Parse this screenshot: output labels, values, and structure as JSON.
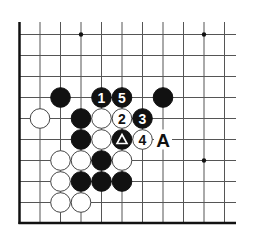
{
  "diagram": {
    "type": "go-board-fragment",
    "grid": {
      "columns": 11,
      "rows": 9,
      "origin_x": 19.5,
      "origin_y": 34.5,
      "col_spacing": 20.5,
      "row_spacing": 21,
      "top_y": 22,
      "bottom_edge_y": 223,
      "right_x": 236,
      "left_edge": true,
      "bottom_edge": true
    },
    "colors": {
      "line": "#555555",
      "edge": "#111111",
      "black_stone": "#111111",
      "white_stone": "#ffffff",
      "stone_outline": "#444444"
    },
    "star_points": [
      {
        "col": 3,
        "row": 0
      },
      {
        "col": 9,
        "row": 0
      },
      {
        "col": 9,
        "row": 6
      }
    ],
    "stones": [
      {
        "color": "black",
        "col": 2,
        "row": 3,
        "label": ""
      },
      {
        "color": "black",
        "col": 4,
        "row": 3,
        "label": "1"
      },
      {
        "color": "black",
        "col": 5,
        "row": 3,
        "label": "5"
      },
      {
        "color": "black",
        "col": 7,
        "row": 3,
        "label": ""
      },
      {
        "color": "white",
        "col": 1,
        "row": 4,
        "label": ""
      },
      {
        "color": "black",
        "col": 3,
        "row": 4,
        "label": ""
      },
      {
        "color": "white",
        "col": 4,
        "row": 4,
        "label": ""
      },
      {
        "color": "white",
        "col": 5,
        "row": 4,
        "label": "2"
      },
      {
        "color": "black",
        "col": 6,
        "row": 4,
        "label": "3"
      },
      {
        "color": "black",
        "col": 3,
        "row": 5,
        "label": ""
      },
      {
        "color": "white",
        "col": 4,
        "row": 5,
        "label": ""
      },
      {
        "color": "black",
        "col": 5,
        "row": 5,
        "label": "",
        "marker": "triangle"
      },
      {
        "color": "white",
        "col": 6,
        "row": 5,
        "label": "4"
      },
      {
        "color": "white",
        "col": 2,
        "row": 6,
        "label": ""
      },
      {
        "color": "white",
        "col": 3,
        "row": 6,
        "label": ""
      },
      {
        "color": "black",
        "col": 4,
        "row": 6,
        "label": ""
      },
      {
        "color": "white",
        "col": 5,
        "row": 6,
        "label": ""
      },
      {
        "color": "white",
        "col": 2,
        "row": 7,
        "label": ""
      },
      {
        "color": "black",
        "col": 3,
        "row": 7,
        "label": ""
      },
      {
        "color": "black",
        "col": 4,
        "row": 7,
        "label": ""
      },
      {
        "color": "black",
        "col": 5,
        "row": 7,
        "label": ""
      },
      {
        "color": "white",
        "col": 2,
        "row": 8,
        "label": ""
      },
      {
        "color": "white",
        "col": 3,
        "row": 8,
        "label": ""
      }
    ],
    "point_labels": [
      {
        "col": 7,
        "row": 5,
        "text": "A"
      }
    ],
    "move_numbers": [
      "1",
      "2",
      "3",
      "4",
      "5"
    ],
    "marker_legend": {
      "triangle": "triangle-marked black stone"
    }
  }
}
